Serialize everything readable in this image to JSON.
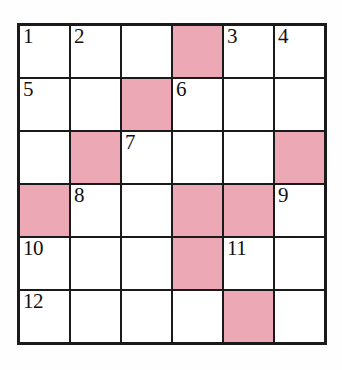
{
  "puzzle": {
    "title": "Crossword Grid",
    "rows": 6,
    "cols": 6,
    "colors": {
      "shaded_cell": "#eda8b5",
      "open_cell": "#ffffff",
      "border": "#1a1a1a",
      "number_text": "#111111",
      "background": "#fefefe"
    },
    "cells": [
      [
        {
          "number": "1",
          "shaded": false
        },
        {
          "number": "2",
          "shaded": false
        },
        {
          "number": "",
          "shaded": false
        },
        {
          "number": "",
          "shaded": true
        },
        {
          "number": "3",
          "shaded": false
        },
        {
          "number": "4",
          "shaded": false
        }
      ],
      [
        {
          "number": "5",
          "shaded": false
        },
        {
          "number": "",
          "shaded": false
        },
        {
          "number": "",
          "shaded": true
        },
        {
          "number": "6",
          "shaded": false
        },
        {
          "number": "",
          "shaded": false
        },
        {
          "number": "",
          "shaded": false
        }
      ],
      [
        {
          "number": "",
          "shaded": false
        },
        {
          "number": "",
          "shaded": true
        },
        {
          "number": "7",
          "shaded": false
        },
        {
          "number": "",
          "shaded": false
        },
        {
          "number": "",
          "shaded": false
        },
        {
          "number": "",
          "shaded": true
        }
      ],
      [
        {
          "number": "",
          "shaded": true
        },
        {
          "number": "8",
          "shaded": false
        },
        {
          "number": "",
          "shaded": false
        },
        {
          "number": "",
          "shaded": true
        },
        {
          "number": "",
          "shaded": true
        },
        {
          "number": "9",
          "shaded": false
        }
      ],
      [
        {
          "number": "10",
          "shaded": false
        },
        {
          "number": "",
          "shaded": false
        },
        {
          "number": "",
          "shaded": false
        },
        {
          "number": "",
          "shaded": true
        },
        {
          "number": "11",
          "shaded": false
        },
        {
          "number": "",
          "shaded": false
        }
      ],
      [
        {
          "number": "12",
          "shaded": false
        },
        {
          "number": "",
          "shaded": false
        },
        {
          "number": "",
          "shaded": false
        },
        {
          "number": "",
          "shaded": false
        },
        {
          "number": "",
          "shaded": true
        },
        {
          "number": "",
          "shaded": false
        }
      ]
    ]
  }
}
